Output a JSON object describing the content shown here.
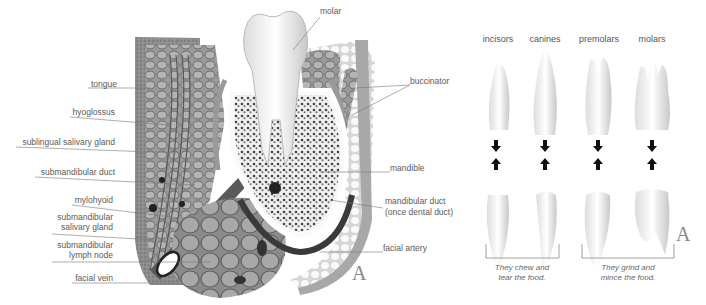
{
  "figure_a": {
    "panel_letter": "A",
    "labels_left": {
      "tongue": "tongue",
      "hyoglossus": "hyoglossus",
      "sublingual_gland": "sublingual salivary gland",
      "submandibular_duct": "submandibular duct",
      "mylohyoid": "mylohyoid",
      "submandibular_gland_1": "submandibular",
      "submandibular_gland_2": "salivary gland",
      "lymph_node_1": "submandibular",
      "lymph_node_2": "lymph node",
      "facial_vein": "facial vein"
    },
    "labels_right": {
      "molar": "molar",
      "buccinator": "buccinator",
      "mandible": "mandible",
      "mandibular_duct_1": "mandibular duct",
      "mandibular_duct_2": "(once dental duct)",
      "facial_artery": "facial artery"
    }
  },
  "figure_b": {
    "panel_letter": "A",
    "tooth_types": [
      "incisors",
      "canines",
      "premolars",
      "molars"
    ],
    "group_captions": [
      {
        "line1": "They chew and",
        "line2": "tear the food."
      },
      {
        "line1": "They grind and",
        "line2": "mince the food."
      }
    ]
  }
}
